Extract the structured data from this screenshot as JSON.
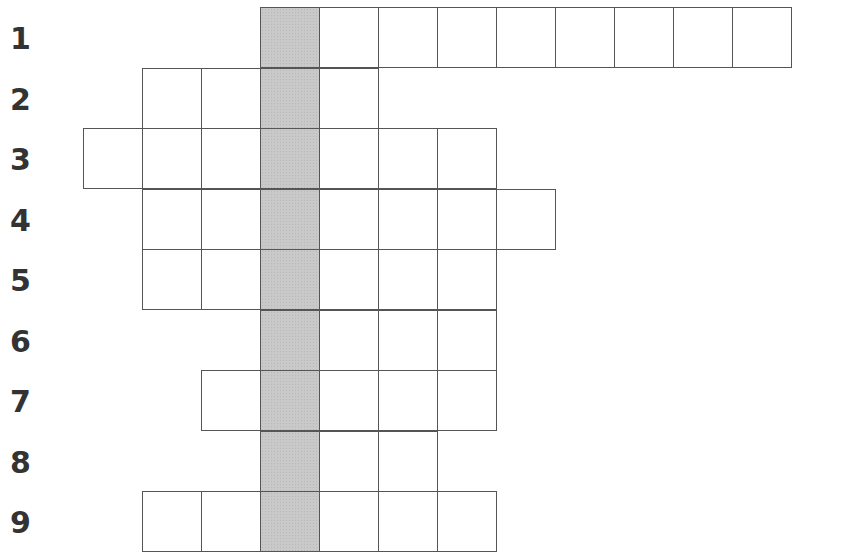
{
  "puzzle": {
    "type": "crossword-grid",
    "colors": {
      "cell_border": "#555555",
      "shaded_column": "#c9c9c9",
      "number": "#333333"
    },
    "shaded_column_index": 3,
    "rows": [
      {
        "number": "1",
        "start_col": 3,
        "end_col": 12
      },
      {
        "number": "2",
        "start_col": 1,
        "end_col": 5
      },
      {
        "number": "3",
        "start_col": 0,
        "end_col": 7
      },
      {
        "number": "4",
        "start_col": 1,
        "end_col": 8
      },
      {
        "number": "5",
        "start_col": 1,
        "end_col": 7
      },
      {
        "number": "6",
        "start_col": 3,
        "end_col": 7
      },
      {
        "number": "7",
        "start_col": 2,
        "end_col": 7
      },
      {
        "number": "8",
        "start_col": 3,
        "end_col": 6
      },
      {
        "number": "9",
        "start_col": 1,
        "end_col": 7
      }
    ]
  }
}
